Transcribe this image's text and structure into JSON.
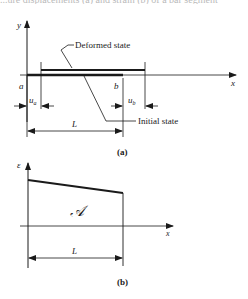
{
  "top_fragment": "...ure displacements (a) and strain (b) of a bar segment",
  "figure_a": {
    "y_axis_label": "y",
    "x_axis_label": "x",
    "deformed_label": "Deformed state",
    "initial_label": "Initial state",
    "point_a_label": "a",
    "point_b_label": "b",
    "ua_label": "u",
    "ua_sub": "a",
    "ub_label": "u",
    "ub_sub": "b",
    "length_label": "L",
    "caption": "(a)"
  },
  "figure_b": {
    "y_axis_label": "ε",
    "x_axis_label": "x",
    "area_label": "𝒜",
    "length_label": "L",
    "caption": "(b)"
  },
  "colors": {
    "ink": "#1a1a1a",
    "background": "#ffffff"
  }
}
